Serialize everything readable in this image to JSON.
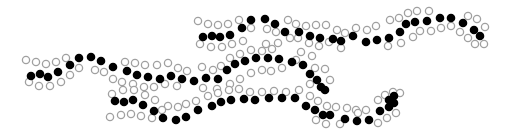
{
  "diagram": {
    "colors": {
      "filled": "#000000",
      "hollow_stroke": "#a0a0a0",
      "background": "#ffffff"
    },
    "radius": {
      "filled": 4.3,
      "hollow": 3.6
    },
    "chains": [
      {
        "name": "upper-right-chain",
        "filled": [
          [
            203,
            37
          ],
          [
            212,
            36
          ],
          [
            220,
            37
          ],
          [
            230,
            35
          ],
          [
            242,
            28
          ],
          [
            251,
            20
          ],
          [
            265,
            19
          ],
          [
            275,
            24
          ],
          [
            285,
            32
          ],
          [
            299,
            32
          ],
          [
            310,
            36
          ],
          [
            320,
            38
          ],
          [
            333,
            39
          ],
          [
            341,
            41
          ],
          [
            353,
            36
          ],
          [
            366,
            42
          ],
          [
            377,
            40
          ],
          [
            389,
            38
          ],
          [
            400,
            32
          ],
          [
            406,
            24
          ],
          [
            415,
            22
          ],
          [
            427,
            21
          ],
          [
            440,
            18
          ],
          [
            451,
            18
          ],
          [
            463,
            23
          ],
          [
            474,
            30
          ],
          [
            480,
            36
          ]
        ],
        "hollow": [
          [
            198,
            21
          ],
          [
            208,
            24
          ],
          [
            218,
            25
          ],
          [
            228,
            24
          ],
          [
            239,
            20
          ],
          [
            251,
            28
          ],
          [
            200,
            44
          ],
          [
            211,
            47
          ],
          [
            222,
            47
          ],
          [
            232,
            44
          ],
          [
            243,
            41
          ],
          [
            267,
            29
          ],
          [
            276,
            32
          ],
          [
            288,
            20
          ],
          [
            296,
            24
          ],
          [
            306,
            26
          ],
          [
            316,
            25
          ],
          [
            326,
            25
          ],
          [
            337,
            30
          ],
          [
            345,
            33
          ],
          [
            266,
            44
          ],
          [
            278,
            43
          ],
          [
            290,
            38
          ],
          [
            298,
            38
          ],
          [
            309,
            43
          ],
          [
            319,
            46
          ],
          [
            329,
            42
          ],
          [
            341,
            48
          ],
          [
            356,
            28
          ],
          [
            367,
            30
          ],
          [
            376,
            26
          ],
          [
            390,
            20
          ],
          [
            399,
            18
          ],
          [
            408,
            13
          ],
          [
            417,
            11
          ],
          [
            429,
            11
          ],
          [
            388,
            46
          ],
          [
            401,
            43
          ],
          [
            413,
            37
          ],
          [
            420,
            31
          ],
          [
            431,
            31
          ],
          [
            441,
            28
          ],
          [
            451,
            26
          ],
          [
            460,
            32
          ],
          [
            468,
            38
          ],
          [
            475,
            44
          ],
          [
            484,
            44
          ],
          [
            468,
            16
          ],
          [
            477,
            19
          ],
          [
            485,
            27
          ]
        ]
      },
      {
        "name": "middle-long-chain",
        "filled": [
          [
            31,
            76
          ],
          [
            40,
            74
          ],
          [
            48,
            77
          ],
          [
            58,
            72
          ],
          [
            70,
            65
          ],
          [
            79,
            58
          ],
          [
            91,
            57
          ],
          [
            101,
            61
          ],
          [
            113,
            67
          ],
          [
            127,
            71
          ],
          [
            137,
            75
          ],
          [
            148,
            77
          ],
          [
            160,
            79
          ],
          [
            171,
            76
          ],
          [
            182,
            79
          ],
          [
            194,
            81
          ],
          [
            206,
            78
          ],
          [
            218,
            79
          ],
          [
            227,
            70
          ],
          [
            235,
            64
          ],
          [
            245,
            61
          ],
          [
            256,
            58
          ],
          [
            268,
            58
          ],
          [
            279,
            59
          ],
          [
            292,
            62
          ],
          [
            303,
            65
          ],
          [
            310,
            74
          ],
          [
            317,
            80
          ],
          [
            321,
            87
          ],
          [
            325,
            90
          ]
        ],
        "hollow": [
          [
            26,
            60
          ],
          [
            36,
            62
          ],
          [
            46,
            64
          ],
          [
            56,
            62
          ],
          [
            66,
            58
          ],
          [
            29,
            82
          ],
          [
            39,
            86
          ],
          [
            50,
            86
          ],
          [
            61,
            82
          ],
          [
            70,
            75
          ],
          [
            79,
            68
          ],
          [
            95,
            70
          ],
          [
            104,
            72
          ],
          [
            113,
            79
          ],
          [
            125,
            62
          ],
          [
            135,
            63
          ],
          [
            145,
            65
          ],
          [
            157,
            65
          ],
          [
            168,
            63
          ],
          [
            178,
            68
          ],
          [
            187,
            71
          ],
          [
            202,
            67
          ],
          [
            213,
            70
          ],
          [
            221,
            66
          ],
          [
            230,
            58
          ],
          [
            240,
            54
          ],
          [
            251,
            50
          ],
          [
            262,
            51
          ],
          [
            272,
            49
          ],
          [
            122,
            82
          ],
          [
            133,
            84
          ],
          [
            144,
            87
          ],
          [
            154,
            87
          ],
          [
            165,
            84
          ],
          [
            177,
            86
          ],
          [
            203,
            88
          ],
          [
            217,
            89
          ],
          [
            230,
            84
          ],
          [
            240,
            79
          ],
          [
            251,
            73
          ],
          [
            262,
            70
          ],
          [
            271,
            71
          ],
          [
            282,
            68
          ],
          [
            296,
            60
          ],
          [
            301,
            52
          ],
          [
            312,
            56
          ],
          [
            315,
            68
          ],
          [
            325,
            69
          ],
          [
            310,
            84
          ],
          [
            330,
            80
          ]
        ]
      },
      {
        "name": "lower-chain",
        "filled": [
          [
            115,
            101
          ],
          [
            124,
            102
          ],
          [
            133,
            100
          ],
          [
            143,
            105
          ],
          [
            154,
            111
          ],
          [
            163,
            118
          ],
          [
            176,
            120
          ],
          [
            186,
            117
          ],
          [
            198,
            110
          ],
          [
            212,
            106
          ],
          [
            221,
            102
          ],
          [
            231,
            100
          ],
          [
            244,
            99
          ],
          [
            255,
            100
          ],
          [
            269,
            98
          ],
          [
            282,
            98
          ],
          [
            295,
            98
          ],
          [
            306,
            106
          ],
          [
            315,
            110
          ],
          [
            323,
            115
          ],
          [
            330,
            115
          ],
          [
            345,
            119
          ],
          [
            357,
            121
          ],
          [
            369,
            120
          ],
          [
            380,
            111
          ],
          [
            389,
            107
          ],
          [
            394,
            103
          ],
          [
            389,
            100
          ],
          [
            394,
            96
          ]
        ],
        "hollow": [
          [
            112,
            94
          ],
          [
            123,
            90
          ],
          [
            134,
            90
          ],
          [
            145,
            95
          ],
          [
            155,
            100
          ],
          [
            168,
            106
          ],
          [
            110,
            117
          ],
          [
            121,
            115
          ],
          [
            131,
            114
          ],
          [
            141,
            116
          ],
          [
            152,
            118
          ],
          [
            162,
            110
          ],
          [
            178,
            107
          ],
          [
            186,
            104
          ],
          [
            196,
            101
          ],
          [
            208,
            96
          ],
          [
            218,
            93
          ],
          [
            229,
            90
          ],
          [
            239,
            89
          ],
          [
            250,
            92
          ],
          [
            262,
            92
          ],
          [
            274,
            91
          ],
          [
            286,
            92
          ],
          [
            299,
            90
          ],
          [
            310,
            96
          ],
          [
            318,
            101
          ],
          [
            327,
            106
          ],
          [
            336,
            107
          ],
          [
            347,
            108
          ],
          [
            356,
            110
          ],
          [
            366,
            110
          ],
          [
            316,
            120
          ],
          [
            326,
            124
          ],
          [
            340,
            124
          ],
          [
            358,
            113
          ],
          [
            378,
            100
          ],
          [
            385,
            95
          ],
          [
            393,
            92
          ],
          [
            378,
            123
          ],
          [
            387,
            118
          ],
          [
            396,
            113
          ],
          [
            400,
            93
          ]
        ]
      }
    ]
  }
}
